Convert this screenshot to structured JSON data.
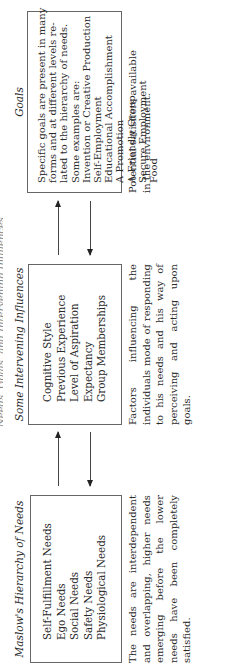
{
  "figure": {
    "cut_title": "Needs, Goals, and Intervening Influences"
  },
  "maslow": {
    "heading": "Maslow's Hierarchy of Needs",
    "items": [
      "Self-Fulfillment Needs",
      "Ego Needs",
      "Social Needs",
      "Safety Needs",
      "Physiological Needs"
    ],
    "caption": "The needs are interdependent and overlapping, higher needs emerging before the lower needs have been completely satisfied."
  },
  "influences": {
    "heading": "Some Intervening Influences",
    "items": [
      "Cognitive Style",
      "Previous Experience",
      "Level of Aspiration",
      "Expectancy",
      "Group Memberships"
    ],
    "caption": "Factors influencing the individuals mode of responding to his needs and his way of perceiving and acting upon goals."
  },
  "goals": {
    "heading": "Goals",
    "intro": [
      "Specific goals are present in many",
      "forms and at different levels re-",
      "lated to the hierarchy of needs.",
      "Some examples are:"
    ],
    "items": [
      "Invention or Creative Production",
      "Self-Employment",
      "Educational Accomplishment",
      "A Promotion",
      "A Friendly Group",
      "Secure Employment",
      "Food"
    ],
    "caption": "Potential satisfiers available in the environment."
  },
  "colors": {
    "ink": "#2a2a2a",
    "border": "#666666",
    "background": "#ffffff"
  }
}
